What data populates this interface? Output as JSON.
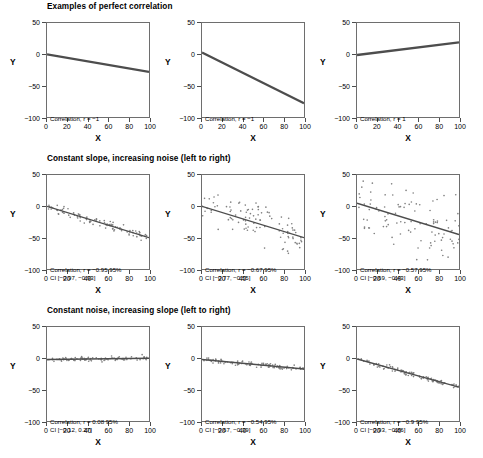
{
  "figure": {
    "width": 483,
    "height": 458,
    "line_color": "#4d4d4d",
    "point_color": "#808080",
    "axis_color": "#6e6e6e"
  },
  "axes": {
    "x_title": "X",
    "y_title": "Y",
    "x_ticks": [
      "0",
      "20",
      "40",
      "60",
      "80",
      "100"
    ],
    "x_tick_values": [
      0,
      20,
      40,
      60,
      80,
      100
    ],
    "y_ticks": [
      "50",
      "0",
      "-50",
      "-100"
    ],
    "y_tick_values": [
      50,
      0,
      -50,
      -100
    ],
    "xlim": [
      0,
      100
    ],
    "ylim": [
      -100,
      50
    ]
  },
  "rows": [
    {
      "title": "Examples of perfect correlation"
    },
    {
      "title": "Constant slope, increasing noise (left to right)"
    },
    {
      "title": "Constant noise, increasing slope (left to right)"
    }
  ],
  "chart_data": {
    "type": "scatter",
    "title": "Examples of perfect correlation",
    "xlabel": "X",
    "ylabel": "Y",
    "xlim": [
      0,
      100
    ],
    "ylim": [
      -100,
      50
    ],
    "grid": false,
    "legend": "none",
    "layout": "3x3 grid of panels",
    "panels": [
      {
        "index": 0,
        "row": 0,
        "col": 0,
        "row_title": "Examples of perfect correlation",
        "annotation_line1": "Correlation, r = −1",
        "annotation_line2": "",
        "r": -1,
        "ci": null,
        "noise_sd": 0,
        "intercept": 0,
        "slope": -0.28,
        "n_points": 0,
        "style": "line-only"
      },
      {
        "index": 1,
        "row": 0,
        "col": 1,
        "row_title": "Examples of perfect correlation",
        "annotation_line1": "Correlation, r = −1",
        "annotation_line2": "",
        "r": -1,
        "ci": null,
        "noise_sd": 0,
        "intercept": 3,
        "slope": -0.81,
        "n_points": 0,
        "style": "line-only"
      },
      {
        "index": 2,
        "row": 0,
        "col": 2,
        "row_title": "Examples of perfect correlation",
        "annotation_line1": "Correlation, r = 1",
        "annotation_line2": "",
        "r": 1,
        "ci": null,
        "noise_sd": 0,
        "intercept": -1,
        "slope": 0.2,
        "n_points": 0,
        "style": "line-only"
      },
      {
        "index": 3,
        "row": 1,
        "col": 0,
        "row_title": "Constant slope, increasing noise (left to right)",
        "annotation_line1": "Correlation, r = −0.95 95%",
        "annotation_line2": "CI [−0.97, −0.93]",
        "r": -0.95,
        "ci": [
          -0.97,
          -0.93
        ],
        "noise_sd": 4,
        "intercept": 0,
        "slope": -0.5,
        "n_points": 100,
        "style": "scatter-with-fit"
      },
      {
        "index": 4,
        "row": 1,
        "col": 1,
        "row_title": "Constant slope, increasing noise (left to right)",
        "annotation_line1": "Correlation, r = −0.67 95%",
        "annotation_line2": "CI [−0.77, −0.55]",
        "r": -0.67,
        "ci": [
          -0.77,
          -0.55
        ],
        "noise_sd": 16,
        "intercept": 0,
        "slope": -0.5,
        "n_points": 100,
        "style": "scatter-with-fit"
      },
      {
        "index": 5,
        "row": 1,
        "col": 2,
        "row_title": "Constant slope, increasing noise (left to right)",
        "annotation_line1": "Correlation, r = −0.57 95%",
        "annotation_line2": "CI [−0.69, −0.43]",
        "r": -0.57,
        "ci": [
          -0.69,
          -0.43
        ],
        "noise_sd": 24,
        "intercept": 5,
        "slope": -0.5,
        "n_points": 100,
        "style": "scatter-with-fit"
      },
      {
        "index": 6,
        "row": 2,
        "col": 0,
        "row_title": "Constant noise, increasing slope (left to right)",
        "annotation_line1": "Correlation, r = 0.08 95%",
        "annotation_line2": "CI [−0.12, 0.27]",
        "r": 0.08,
        "ci": [
          -0.12,
          0.27
        ],
        "noise_sd": 2,
        "intercept": -2,
        "slope": 0.02,
        "n_points": 100,
        "style": "scatter-with-fit"
      },
      {
        "index": 7,
        "row": 2,
        "col": 1,
        "row_title": "Constant noise, increasing slope (left to right)",
        "annotation_line1": "Correlation, r = −0.54 95%",
        "annotation_line2": "CI [−0.67, −0.39]",
        "r": -0.54,
        "ci": [
          -0.67,
          -0.39
        ],
        "noise_sd": 2,
        "intercept": -2,
        "slope": -0.15,
        "n_points": 100,
        "style": "scatter-with-fit"
      },
      {
        "index": 8,
        "row": 2,
        "col": 2,
        "row_title": "Constant noise, increasing slope (left to right)",
        "annotation_line1": "Correlation, r = −0.9 95%",
        "annotation_line2": "CI [−0.93, −0.86]",
        "r": -0.9,
        "ci": [
          -0.93,
          -0.86
        ],
        "noise_sd": 2,
        "intercept": -1,
        "slope": -0.45,
        "n_points": 100,
        "style": "scatter-with-fit"
      }
    ]
  }
}
